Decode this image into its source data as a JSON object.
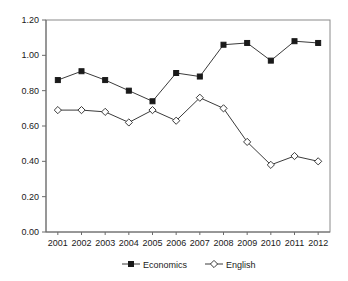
{
  "chart_data": {
    "type": "line",
    "title": "",
    "xlabel": "",
    "ylabel": "",
    "categories": [
      "2001",
      "2002",
      "2003",
      "2004",
      "2005",
      "2006",
      "2007",
      "2008",
      "2009",
      "2010",
      "2011",
      "2012"
    ],
    "series": [
      {
        "name": "Economics",
        "marker": "filled-square",
        "values": [
          0.86,
          0.91,
          0.86,
          0.8,
          0.74,
          0.9,
          0.88,
          1.06,
          1.07,
          0.97,
          1.08,
          1.07
        ]
      },
      {
        "name": "English",
        "marker": "open-diamond",
        "values": [
          0.69,
          0.69,
          0.68,
          0.62,
          0.69,
          0.63,
          0.76,
          0.7,
          0.51,
          0.38,
          0.43,
          0.4
        ]
      }
    ],
    "ylim": [
      0.0,
      1.2
    ],
    "ytick_labels": [
      "0.00",
      "0.20",
      "0.40",
      "0.60",
      "0.80",
      "1.00",
      "1.20"
    ],
    "ytick_values": [
      0.0,
      0.2,
      0.4,
      0.6,
      0.8,
      1.0,
      1.2
    ],
    "grid": false,
    "legend_position": "bottom",
    "legend_entries": [
      "Economics",
      "English"
    ],
    "colors": {
      "economics_marker": "#1a1a1a",
      "english_marker": "#ffffff",
      "line": "#3b3b3b",
      "axis": "#6b6b6b",
      "border": "#8a8a8a",
      "background": "#ffffff",
      "text": "#1a1a1a"
    }
  }
}
